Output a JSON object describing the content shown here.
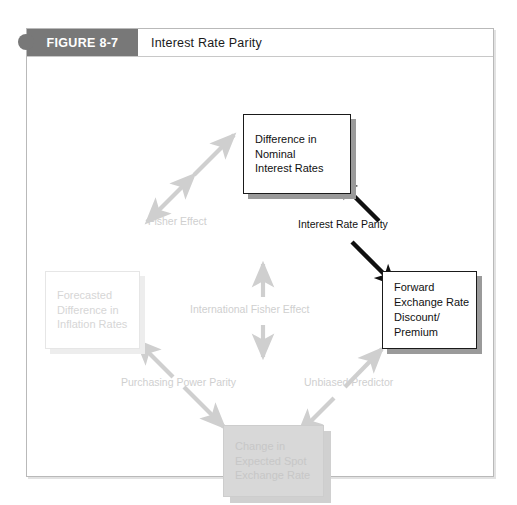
{
  "figure": {
    "number": "FIGURE 8-7",
    "title": "Interest Rate Parity"
  },
  "nodes": {
    "nominal": {
      "label": "Difference in\nNominal\nInterest Rates",
      "style": "strong"
    },
    "forward": {
      "label": "Forward\nExchange Rate\nDiscount/\nPremium",
      "style": "strong"
    },
    "inflation": {
      "label": "Forecasted\nDifference in\nInflation Rates",
      "style": "faded"
    },
    "spot": {
      "label": "Change in\nExpected Spot\nExchange Rate",
      "style": "grayfill"
    }
  },
  "edges": {
    "fisher_effect": "Fisher Effect",
    "interest_rate_parity": "Interest Rate Parity",
    "international_fisher_effect": "International Fisher Effect",
    "purchasing_power_parity": "Purchasing Power Parity",
    "unbiased_predictor": "Unbiased Predictor"
  },
  "colors": {
    "tab_background": "#787878",
    "strong_border": "#1a1a1a",
    "faded_text": "#cfcfcf",
    "gray_fill": "#d8d8d8",
    "frame_border": "#b9b9b9"
  }
}
